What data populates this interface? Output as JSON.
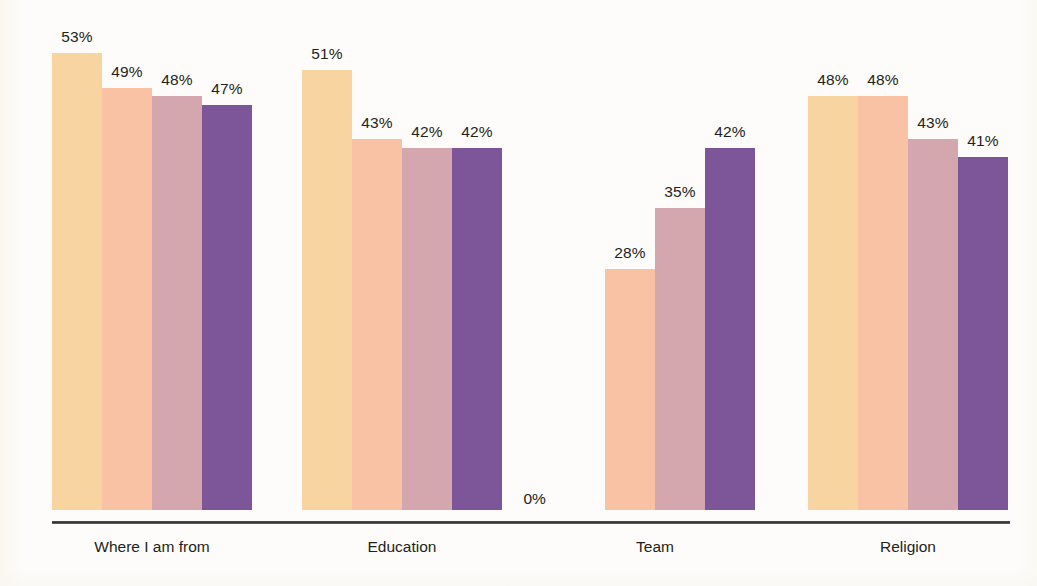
{
  "chart_data": {
    "type": "bar",
    "title": "",
    "subtitle": "",
    "xlabel": "",
    "ylabel": "",
    "ylim": [
      0,
      60
    ],
    "grid": false,
    "legend_position": "none",
    "value_suffix": "%",
    "categories": [
      "Where I am from",
      "Education",
      "Team",
      "Religion"
    ],
    "series": [
      {
        "name": "series-1",
        "color": "#f8d4a0",
        "values": [
          53,
          51,
          0,
          48
        ]
      },
      {
        "name": "series-2",
        "color": "#f9c2a4",
        "values": [
          49,
          43,
          28,
          48
        ]
      },
      {
        "name": "series-3",
        "color": "#d3a7ad",
        "values": [
          48,
          42,
          35,
          43
        ]
      },
      {
        "name": "series-4",
        "color": "#7d5699",
        "values": [
          47,
          42,
          42,
          41
        ]
      }
    ],
    "value_labels": [
      [
        "53%",
        "49%",
        "48%",
        "47%"
      ],
      [
        "51%",
        "43%",
        "42%",
        "42%"
      ],
      [
        "0%",
        "28%",
        "35%",
        "42%"
      ],
      [
        "48%",
        "48%",
        "43%",
        "41%"
      ]
    ]
  },
  "groups": [
    {
      "label": "Where I am from",
      "bars": [
        {
          "label": "53%",
          "value": 53,
          "color": "#f8d4a0",
          "label_placement": "above"
        },
        {
          "label": "49%",
          "value": 49,
          "color": "#f9c2a4",
          "label_placement": "above"
        },
        {
          "label": "48%",
          "value": 48,
          "color": "#d3a7ad",
          "label_placement": "above"
        },
        {
          "label": "47%",
          "value": 47,
          "color": "#7d5699",
          "label_placement": "above"
        }
      ]
    },
    {
      "label": "Education",
      "bars": [
        {
          "label": "51%",
          "value": 51,
          "color": "#f8d4a0",
          "label_placement": "above"
        },
        {
          "label": "43%",
          "value": 43,
          "color": "#f9c2a4",
          "label_placement": "above"
        },
        {
          "label": "42%",
          "value": 42,
          "color": "#d3a7ad",
          "label_placement": "above"
        },
        {
          "label": "42%",
          "value": 42,
          "color": "#7d5699",
          "label_placement": "above"
        }
      ]
    },
    {
      "label": "Team",
      "bars": [
        {
          "label": "0%",
          "value": 0,
          "color": "#f8d4a0",
          "label_placement": "left"
        },
        {
          "label": "28%",
          "value": 28,
          "color": "#f9c2a4",
          "label_placement": "above"
        },
        {
          "label": "35%",
          "value": 35,
          "color": "#d3a7ad",
          "label_placement": "above"
        },
        {
          "label": "42%",
          "value": 42,
          "color": "#7d5699",
          "label_placement": "above"
        }
      ]
    },
    {
      "label": "Religion",
      "bars": [
        {
          "label": "48%",
          "value": 48,
          "color": "#f8d4a0",
          "label_placement": "above"
        },
        {
          "label": "48%",
          "value": 48,
          "color": "#f9c2a4",
          "label_placement": "above"
        },
        {
          "label": "43%",
          "value": 43,
          "color": "#d3a7ad",
          "label_placement": "above"
        },
        {
          "label": "41%",
          "value": 41,
          "color": "#7d5699",
          "label_placement": "above"
        }
      ]
    }
  ],
  "layout": {
    "group_left_px": [
      52,
      302,
      555,
      808
    ],
    "bar_width_px": 50,
    "baseline_y_px": 510,
    "pixels_per_unit": 8.62,
    "axis_color": "#2f2e31",
    "background": "#fdfcfa",
    "text_color": "#231f20"
  }
}
